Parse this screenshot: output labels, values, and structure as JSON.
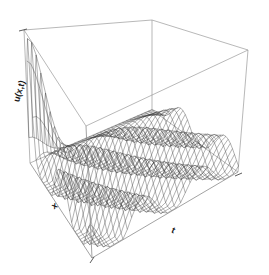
{
  "figure": {
    "type": "surface-3d-wireframe",
    "background_color": "#ffffff",
    "line_color": "#333333",
    "box_color": "#9a9a9a"
  },
  "labels": {
    "z_axis": "u(x,t)",
    "x_axis": "x",
    "t_axis": "t"
  },
  "chart_data": {
    "type": "surface",
    "title": "",
    "xlabel": "x",
    "ylabel": "t",
    "zlabel": "u(x,t)",
    "projection": "persp",
    "grid": false,
    "legend": "none",
    "box": true,
    "ticks_visible": true,
    "tick_labels": [],
    "view": {
      "theta": -40,
      "phi": 22,
      "d": 3.2,
      "expand": 0.62
    },
    "xlim": [
      0,
      1
    ],
    "ylim": [
      0,
      1
    ],
    "zlim": [
      0,
      1
    ],
    "nx": 38,
    "nt": 34,
    "surface_model": {
      "pulse": {
        "amplitude": 1.0,
        "center_x": 0.045,
        "width_x": 0.035,
        "decay_t": 14.0
      },
      "wave": {
        "amplitude": 0.3,
        "speed": 1.35,
        "wavelength": 0.52,
        "damping": 0.55,
        "offset": 0.1
      }
    }
  }
}
